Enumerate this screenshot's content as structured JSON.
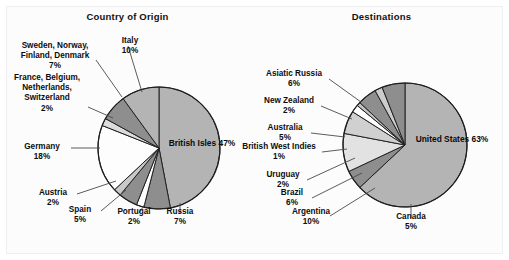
{
  "figure": {
    "background": "#fcfcfc",
    "border_color": "#efefef"
  },
  "panels": [
    {
      "id": "origin",
      "title": "Country of Origin",
      "center": {
        "x": 159,
        "y": 148
      },
      "radius": 61
    },
    {
      "id": "destinations",
      "title": "Destinations",
      "center": {
        "x": 405,
        "y": 145
      },
      "radius": 62
    }
  ],
  "labels": {
    "origin": {
      "italy": {
        "name": "Italy",
        "pct": "10%"
      },
      "sweden": {
        "name": "Sweden, Norway,\nFinland, Denmark",
        "line1": "Sweden, Norway,",
        "line2": "Finland, Denmark",
        "pct": "7%"
      },
      "france": {
        "line1": "France, Belgium,",
        "line2": "Netherlands,",
        "line3": "Switzerland",
        "pct": "2%"
      },
      "germany": {
        "name": "Germany",
        "pct": "18%"
      },
      "austria": {
        "name": "Austria",
        "pct": "2%"
      },
      "spain": {
        "name": "Spain",
        "pct": "5%"
      },
      "portugal": {
        "name": "Portugal",
        "pct": "2%"
      },
      "russia": {
        "name": "Russia",
        "pct": "7%"
      },
      "britishisles": {
        "name": "British Isles",
        "pct": "47%"
      }
    },
    "destinations": {
      "asiatic": {
        "name": "Asiatic Russia",
        "pct": "6%"
      },
      "newzealand": {
        "name": "New Zealand",
        "pct": "2%"
      },
      "australia": {
        "name": "Australia",
        "pct": "5%"
      },
      "bwi": {
        "name": "British West Indies",
        "pct": "1%"
      },
      "uruguay": {
        "name": "Uruguay",
        "pct": "2%"
      },
      "brazil": {
        "name": "Brazil",
        "pct": "6%"
      },
      "argentina": {
        "name": "Argentina",
        "pct": "10%"
      },
      "canada": {
        "name": "Canada",
        "pct": "5%"
      },
      "unitedstates": {
        "name": "United States",
        "pct": "63%"
      }
    }
  },
  "chart_data": [
    {
      "type": "pie",
      "title": "Country of Origin",
      "start_angle_deg": 0,
      "direction": "clockwise",
      "unit": "percent",
      "categories": [
        "British Isles",
        "Russia",
        "Portugal",
        "Spain",
        "Austria",
        "Germany",
        "France, Belgium, Netherlands, Switzerland",
        "Sweden, Norway, Finland, Denmark",
        "Italy"
      ],
      "values": [
        47,
        7,
        2,
        5,
        2,
        18,
        2,
        7,
        10
      ],
      "slice_colors": [
        "#b4b4b4",
        "#8e8e8e",
        "#ffffff",
        "#8e8e8e",
        "#c9c9c9",
        "#fdfdfd",
        "#dcdcdc",
        "#8e8e8e",
        "#b4b4b4"
      ],
      "labels": [
        "British Isles 47%",
        "Russia 7%",
        "Portugal 2%",
        "Spain 5%",
        "Austria 2%",
        "Germany 18%",
        "France, Belgium, Netherlands, Switzerland 2%",
        "Sweden, Norway, Finland, Denmark 7%",
        "Italy 10%"
      ],
      "legend": "none",
      "grid": false
    },
    {
      "type": "pie",
      "title": "Destinations",
      "start_angle_deg": 0,
      "direction": "clockwise",
      "unit": "percent",
      "categories": [
        "United States",
        "Canada",
        "Argentina",
        "Brazil",
        "Uruguay",
        "British West Indies",
        "Australia",
        "New Zealand",
        "Asiatic Russia"
      ],
      "values": [
        63,
        5,
        10,
        6,
        2,
        1,
        5,
        2,
        6
      ],
      "slice_colors": [
        "#b4b4b4",
        "#8e8e8e",
        "#e2e2e2",
        "#d0d0d0",
        "#ffffff",
        "#c4c4c4",
        "#8e8e8e",
        "#cccccc",
        "#8e8e8e"
      ],
      "labels": [
        "United States 63%",
        "Canada 5%",
        "Argentina 10%",
        "Brazil 6%",
        "Uruguay 2%",
        "British West Indies 1%",
        "Australia 5%",
        "New Zealand 2%",
        "Asiatic Russia 6%"
      ],
      "legend": "none",
      "grid": false
    }
  ],
  "leader_lines": {
    "origin": [
      {
        "name": "italy",
        "x1": 128,
        "y1": 46,
        "x2": 142,
        "y2": 92
      },
      {
        "name": "sweden",
        "x1": 96,
        "y1": 60,
        "x2": 122,
        "y2": 97
      },
      {
        "name": "france",
        "x1": 88,
        "y1": 107,
        "x2": 113,
        "y2": 118
      },
      {
        "name": "germany",
        "x1": 71,
        "y1": 148,
        "x2": 100,
        "y2": 148
      },
      {
        "name": "austria",
        "x1": 77,
        "y1": 194,
        "x2": 116,
        "y2": 181
      },
      {
        "name": "spain",
        "x1": 101,
        "y1": 211,
        "x2": 126,
        "y2": 190
      },
      {
        "name": "portugal",
        "x1": 139,
        "y1": 213,
        "x2": 145,
        "y2": 204
      },
      {
        "name": "russia",
        "x1": 180,
        "y1": 214,
        "x2": 180,
        "y2": 203
      }
    ],
    "destinations": [
      {
        "name": "asiatic",
        "x1": 329,
        "y1": 79,
        "x2": 361,
        "y2": 102
      },
      {
        "name": "newzealand",
        "x1": 321,
        "y1": 106,
        "x2": 352,
        "y2": 119
      },
      {
        "name": "australia",
        "x1": 311,
        "y1": 133,
        "x2": 345,
        "y2": 137
      },
      {
        "name": "bwi",
        "x1": 322,
        "y1": 152,
        "x2": 347,
        "y2": 149
      },
      {
        "name": "uruguay",
        "x1": 307,
        "y1": 180,
        "x2": 355,
        "y2": 158
      },
      {
        "name": "brazil",
        "x1": 312,
        "y1": 198,
        "x2": 362,
        "y2": 173
      },
      {
        "name": "argentina",
        "x1": 330,
        "y1": 216,
        "x2": 375,
        "y2": 188
      },
      {
        "name": "canada",
        "x1": 411,
        "y1": 218,
        "x2": 411,
        "y2": 204
      }
    ]
  }
}
